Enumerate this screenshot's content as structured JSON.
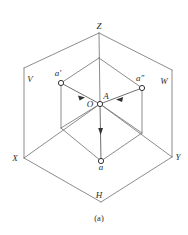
{
  "figure": {
    "caption": "(a)",
    "type": "three-plane-orthographic-projection-diagram"
  },
  "labels": {
    "axis_z": "Z",
    "axis_x": "X",
    "axis_y": "Y",
    "plane_v": "V",
    "plane_w": "W",
    "plane_h": "H",
    "origin": "O",
    "point_a": "A",
    "point_a_front": "a'",
    "point_a_side": "a″",
    "point_a_top": "a"
  },
  "geometry": {
    "z_apex": {
      "x": 99,
      "y": 33
    },
    "origin": {
      "x": 100,
      "y": 104
    },
    "point_a": {
      "x": 100,
      "y": 104
    },
    "a_front": {
      "x": 61,
      "y": 83
    },
    "a_side": {
      "x": 142,
      "y": 88
    },
    "a_top": {
      "x": 101,
      "y": 161
    },
    "x_corner": {
      "x": 24,
      "y": 158
    },
    "y_corner": {
      "x": 172,
      "y": 157
    },
    "h_bottom": {
      "x": 101,
      "y": 202
    },
    "v_top_corner": {
      "x": 24,
      "y": 68
    },
    "w_top_corner": {
      "x": 172,
      "y": 70
    },
    "inner_left": {
      "x": 61,
      "y": 128
    },
    "inner_right": {
      "x": 142,
      "y": 133
    },
    "inner_top": {
      "x": 99,
      "y": 58
    }
  },
  "colors": {
    "line": "#6e6e6e",
    "line_dark": "#555555",
    "text": "#2b2b2b",
    "node_fill": "#ffffff",
    "node_stroke": "#333333",
    "background": "#ffffff"
  },
  "arrows": [
    {
      "name": "a-front-to-A",
      "from": "a'",
      "to": "A"
    },
    {
      "name": "a-side-to-A",
      "from": "a″",
      "to": "A"
    },
    {
      "name": "A-to-a-top",
      "from": "A",
      "to": "a"
    }
  ]
}
